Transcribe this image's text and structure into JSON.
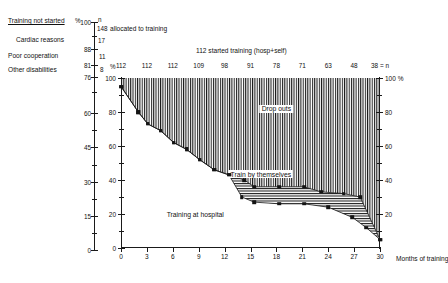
{
  "legend": {
    "rows": [
      {
        "label": "Training not started",
        "pct": "100",
        "n": "148",
        "note": "allocated to training",
        "underline": true
      },
      {
        "label": "Cardiac reasons",
        "pct": "88",
        "n": "17",
        "note": "",
        "underline": false
      },
      {
        "label": "Poor cooperation",
        "pct": "81",
        "n": "11",
        "note": "",
        "underline": false
      },
      {
        "label": "Other disabilities",
        "pct": "76",
        "n": "8",
        "note": "",
        "underline": false
      }
    ],
    "pct_header": "%",
    "n_header": "n"
  },
  "outer_axis": {
    "unit": "%",
    "ticks": [
      "100",
      "88",
      "81",
      "76",
      "60",
      "45",
      "30",
      "15",
      "0"
    ]
  },
  "headers": {
    "started": "112 started training (hosp+self)",
    "allocated": "148 allocated to training"
  },
  "chart_data": {
    "type": "area",
    "title": "112 started training (hosp+self)",
    "xlabel": "Months of training",
    "ylabel": "%",
    "ylabel_right": "100 %",
    "xlim": [
      0,
      30
    ],
    "ylim": [
      0,
      100
    ],
    "grid": false,
    "x_ticks": [
      "0",
      "3",
      "6",
      "9",
      "12",
      "15",
      "18",
      "21",
      "24",
      "27",
      "30"
    ],
    "y_ticks": [
      "0",
      "20",
      "40",
      "60",
      "80",
      "100"
    ],
    "y_ticks_right": [
      "0",
      "20",
      "40",
      "60",
      "80",
      "100"
    ],
    "top_axis_label": "%",
    "top_axis_n_suffix": "38 = n",
    "n_at_x": [
      {
        "x": 0,
        "n": "112"
      },
      {
        "x": 3,
        "n": "112"
      },
      {
        "x": 6,
        "n": "112"
      },
      {
        "x": 9,
        "n": "109"
      },
      {
        "x": 12,
        "n": "98"
      },
      {
        "x": 15,
        "n": "91"
      },
      {
        "x": 18,
        "n": "78"
      },
      {
        "x": 21,
        "n": "71"
      },
      {
        "x": 24,
        "n": "63"
      },
      {
        "x": 27,
        "n": "48"
      },
      {
        "x": 30,
        "n": "38 = n"
      }
    ],
    "regions": [
      {
        "name": "Drop outs",
        "label": "Drop outs",
        "hatch": "vertical",
        "label_x": 18.0,
        "label_y": 82
      },
      {
        "name": "Train by themselves",
        "label": "Train by themselves",
        "hatch": "horizontal",
        "label_x": 16.2,
        "label_y": 43.5
      },
      {
        "name": "Training at hospital",
        "label": "Training at hospital",
        "hatch": "none",
        "label_x": 8.6,
        "label_y": 20
      }
    ],
    "series": [
      {
        "name": "Top of train-by-themselves band",
        "marker": "square",
        "points": [
          {
            "x": 0.0,
            "y": 95
          },
          {
            "x": 2.0,
            "y": 80
          },
          {
            "x": 3.1,
            "y": 73
          },
          {
            "x": 4.6,
            "y": 69
          },
          {
            "x": 6.1,
            "y": 62
          },
          {
            "x": 7.6,
            "y": 58
          },
          {
            "x": 9.1,
            "y": 52
          },
          {
            "x": 10.8,
            "y": 46
          },
          {
            "x": 12.5,
            "y": 43
          },
          {
            "x": 14.3,
            "y": 40
          },
          {
            "x": 15.4,
            "y": 36
          },
          {
            "x": 18.3,
            "y": 36
          },
          {
            "x": 21.2,
            "y": 36
          },
          {
            "x": 23.2,
            "y": 33
          },
          {
            "x": 25.8,
            "y": 32
          },
          {
            "x": 27.7,
            "y": 30
          },
          {
            "x": 30.0,
            "y": 5
          }
        ]
      },
      {
        "name": "Top of training-at-hospital band",
        "marker": "square",
        "points": [
          {
            "x": 0.0,
            "y": 95
          },
          {
            "x": 2.0,
            "y": 80
          },
          {
            "x": 3.1,
            "y": 73
          },
          {
            "x": 4.6,
            "y": 69
          },
          {
            "x": 6.1,
            "y": 62
          },
          {
            "x": 7.6,
            "y": 58
          },
          {
            "x": 9.1,
            "y": 52
          },
          {
            "x": 10.8,
            "y": 46
          },
          {
            "x": 12.5,
            "y": 43
          },
          {
            "x": 14.0,
            "y": 30
          },
          {
            "x": 15.4,
            "y": 27
          },
          {
            "x": 18.3,
            "y": 26
          },
          {
            "x": 21.2,
            "y": 26
          },
          {
            "x": 24.0,
            "y": 24
          },
          {
            "x": 26.8,
            "y": 18
          },
          {
            "x": 28.4,
            "y": 12
          },
          {
            "x": 30.0,
            "y": 5
          }
        ]
      }
    ]
  },
  "footer": {
    "x_axis_caption": "Months of training"
  },
  "colors": {
    "ink": "#141414",
    "background": "#ffffff"
  }
}
